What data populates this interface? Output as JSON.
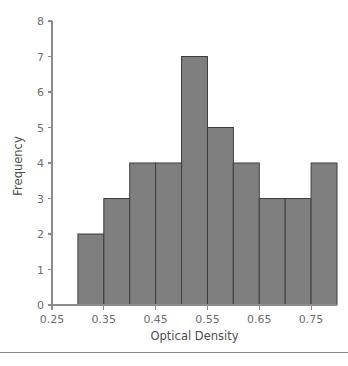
{
  "figure": {
    "background_color": "#ffffff",
    "footer_rule_color": "#8a8a8a"
  },
  "chart_data": {
    "type": "bar",
    "subtype": "histogram",
    "title": "",
    "xlabel": "Optical Density",
    "ylabel": "Frequency",
    "xlim": [
      0.25,
      0.8
    ],
    "ylim": [
      0,
      8
    ],
    "grid": false,
    "legend": null,
    "bin_width": 0.05,
    "bin_edges": [
      0.3,
      0.35,
      0.4,
      0.45,
      0.5,
      0.55,
      0.6,
      0.65,
      0.7,
      0.75,
      0.8
    ],
    "categories": [
      "0.30-0.35",
      "0.35-0.40",
      "0.40-0.45",
      "0.45-0.50",
      "0.50-0.55",
      "0.55-0.60",
      "0.60-0.65",
      "0.65-0.70",
      "0.70-0.75",
      "0.75-0.80"
    ],
    "values": [
      2,
      3,
      4,
      4,
      7,
      5,
      4,
      3,
      3,
      4
    ],
    "total_count": 39,
    "bar_fill_color": "#7f7f7f",
    "bar_edge_color": "#3d3d3d",
    "x_ticks": [
      0.25,
      0.35,
      0.45,
      0.55,
      0.65,
      0.75
    ],
    "x_tick_labels": [
      "0.25",
      "0.35",
      "0.45",
      "0.55",
      "0.65",
      "0.75"
    ],
    "y_ticks": [
      0,
      1,
      2,
      3,
      4,
      5,
      6,
      7,
      8
    ],
    "y_tick_labels": [
      "0",
      "1",
      "2",
      "3",
      "4",
      "5",
      "6",
      "7",
      "8"
    ],
    "axis_color": "#8c8c8c",
    "tick_label_color": "#6e6e6e",
    "axis_title_color": "#4d4d4d"
  }
}
